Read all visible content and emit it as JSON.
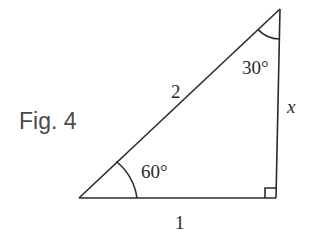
{
  "figure": {
    "caption": "Fig. 4",
    "type": "right-triangle",
    "vertices": {
      "bottom_left": [
        79,
        198
      ],
      "bottom_right": [
        276,
        198
      ],
      "top": [
        280,
        9
      ]
    },
    "sides": {
      "hypotenuse_label": "2",
      "base_label": "1",
      "vertical_label": "x"
    },
    "angles": {
      "bottom_left_label": "60°",
      "top_label": "30°",
      "right_angle_marker": true
    },
    "colors": {
      "line": "#2a2a2a",
      "caption": "#4a4a4a",
      "background": "#ffffff"
    }
  }
}
